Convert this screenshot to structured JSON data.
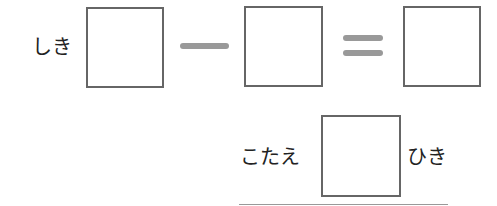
{
  "equation": {
    "label": "しき",
    "operator_minus": "minus-sign",
    "operator_equals": "equals-sign",
    "boxes": [
      "",
      "",
      ""
    ]
  },
  "answer": {
    "label": "こたえ",
    "value": "",
    "unit": "ひき"
  },
  "colors": {
    "box_border": "#666666",
    "operator": "#999999",
    "text": "#222222"
  }
}
